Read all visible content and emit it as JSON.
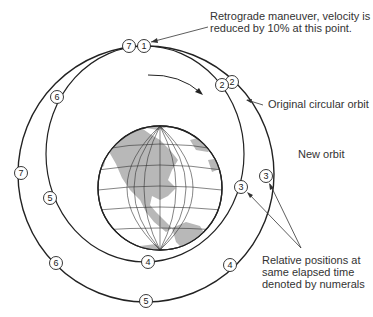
{
  "diagram": {
    "annotations": {
      "retrograde_line1": "Retrograde maneuver, velocity is",
      "retrograde_line2": "reduced by 10% at this point.",
      "original_orbit": "Original circular orbit",
      "new_orbit": "New orbit",
      "relative_line1": "Relative positions at",
      "relative_line2": "same elapsed time",
      "relative_line3": "denoted by numerals"
    },
    "original_orbit_markers": [
      {
        "label": "1",
        "x": 144,
        "y": 46
      },
      {
        "label": "2",
        "x": 232,
        "y": 82
      },
      {
        "label": "3",
        "x": 266,
        "y": 176
      },
      {
        "label": "4",
        "x": 230,
        "y": 265
      },
      {
        "label": "5",
        "x": 146,
        "y": 301
      },
      {
        "label": "6",
        "x": 56,
        "y": 263
      },
      {
        "label": "7",
        "x": 21,
        "y": 173
      }
    ],
    "new_orbit_markers": [
      {
        "label": "7",
        "x": 129,
        "y": 46
      },
      {
        "label": "2",
        "x": 222,
        "y": 85
      },
      {
        "label": "3",
        "x": 241,
        "y": 187
      },
      {
        "label": "4",
        "x": 148,
        "y": 262
      },
      {
        "label": "5",
        "x": 50,
        "y": 198
      },
      {
        "label": "6",
        "x": 57,
        "y": 97
      }
    ],
    "colors": {
      "line": "#222222",
      "land": "#b8b8b8",
      "ocean": "#ffffff"
    }
  }
}
